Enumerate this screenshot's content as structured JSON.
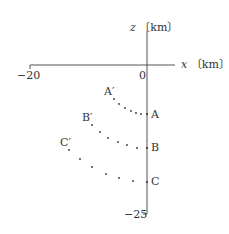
{
  "axes": {
    "z_label_var": "z",
    "z_label_unit": "〔km〕",
    "x_label_var": "x",
    "x_label_unit": "〔km〕",
    "origin": "0",
    "x_min_tick": "−20",
    "z_min_tick": "−25"
  },
  "points": {
    "A": "A",
    "A_prime": "A′",
    "B": "B",
    "B_prime": "B′",
    "C": "C",
    "C_prime": "C′"
  },
  "colors": {
    "axis": "#555555",
    "text": "#333333",
    "dots": "#333333"
  }
}
